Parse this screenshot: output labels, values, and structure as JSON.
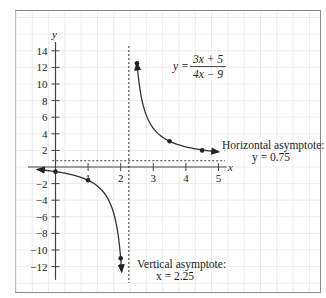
{
  "chart_data": {
    "type": "line",
    "title": "",
    "xlabel": "x",
    "ylabel": "y",
    "xlim": [
      -0.7,
      5.8
    ],
    "ylim": [
      -15,
      17
    ],
    "x_ticks": [
      1,
      2,
      3,
      4,
      5
    ],
    "x_tick_labels": [
      "1",
      "2",
      "3",
      "4",
      "5"
    ],
    "y_ticks": [
      14,
      12,
      10,
      8,
      6,
      4,
      2,
      -2,
      -4,
      -6,
      -8,
      -10,
      -12
    ],
    "y_tick_labels": [
      "14",
      "12",
      "10",
      "8",
      "6",
      "4",
      "2",
      "−2",
      "−4",
      "−6",
      "−8",
      "−10",
      "−12"
    ],
    "grid": true,
    "function": {
      "label_lhs": "y =",
      "numerator": "3x + 5",
      "denominator": "4x − 9",
      "numer_coeffs": [
        3,
        5
      ],
      "denom_coeffs": [
        4,
        -9
      ]
    },
    "series": [
      {
        "name": "left-branch",
        "x_range": [
          -0.55,
          2.03
        ],
        "points": [
          {
            "x": 0,
            "y": -0.56
          },
          {
            "x": 1,
            "y": -1.6
          },
          {
            "x": 2,
            "y": -11
          }
        ]
      },
      {
        "name": "right-branch",
        "x_range": [
          2.5,
          5.0
        ],
        "points": [
          {
            "x": 2.5,
            "y": 12.5
          },
          {
            "x": 3.5,
            "y": 3.1
          },
          {
            "x": 4.5,
            "y": 2.0
          }
        ]
      }
    ],
    "asymptotes": {
      "horizontal": {
        "y": 0.75,
        "label_line1": "Horizontal asymptote:",
        "label_line2": "y = 0.75"
      },
      "vertical": {
        "x": 2.25,
        "label_line1": "Vertical asymptote:",
        "label_line2": "x = 2.25"
      }
    }
  }
}
